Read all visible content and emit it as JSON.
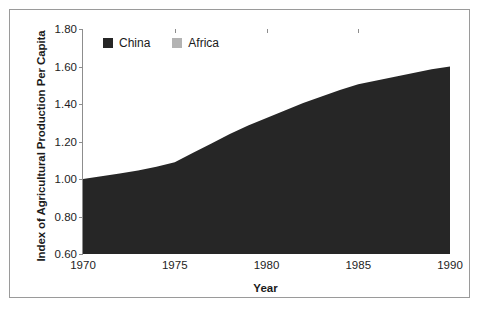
{
  "chart_data": {
    "type": "area",
    "title": "",
    "subtitle": "",
    "xlabel": "Year",
    "ylabel": "Index of Agricultural Production Per Capita",
    "xlim": [
      1970,
      1990
    ],
    "ylim": [
      0.6,
      1.8
    ],
    "ytick_labels": [
      "0.60",
      "0.80",
      "1.00",
      "1.20",
      "1.40",
      "1.60",
      "1.80"
    ],
    "ytick_values": [
      0.6,
      0.8,
      1.0,
      1.2,
      1.4,
      1.6,
      1.8
    ],
    "xtick_labels": [
      "1970",
      "1975",
      "1980",
      "1985",
      "1990"
    ],
    "xtick_values": [
      1970,
      1975,
      1980,
      1985,
      1990
    ],
    "grid": false,
    "legend_position": "top-left",
    "overlap_mode": "overlaid",
    "x": [
      1970,
      1971,
      1972,
      1973,
      1974,
      1975,
      1976,
      1977,
      1978,
      1979,
      1980,
      1981,
      1982,
      1983,
      1984,
      1985,
      1986,
      1987,
      1988,
      1989,
      1990
    ],
    "series": [
      {
        "name": "China",
        "color": "#262626",
        "values": [
          1.0,
          1.015,
          1.03,
          1.045,
          1.065,
          1.09,
          1.14,
          1.19,
          1.24,
          1.285,
          1.325,
          1.365,
          1.405,
          1.44,
          1.475,
          1.505,
          1.525,
          1.545,
          1.565,
          1.585,
          1.6
        ]
      },
      {
        "name": "Africa",
        "color": "#b3b3b3",
        "values": [
          1.0,
          0.99,
          0.98,
          0.972,
          0.964,
          0.957,
          0.95,
          0.944,
          0.938,
          0.932,
          0.927,
          0.922,
          0.918,
          0.915,
          0.912,
          0.91,
          0.905,
          0.9,
          0.895,
          0.89,
          0.882
        ]
      }
    ]
  },
  "legend": {
    "items": [
      {
        "label": "China",
        "color": "#262626"
      },
      {
        "label": "Africa",
        "color": "#b3b3b3"
      }
    ]
  },
  "colors": {
    "china": "#262626",
    "africa": "#b3b3b3",
    "axis": "#8d8d8d",
    "frame": "#9a9a9a",
    "text": "#1d1d1d",
    "background": "#ffffff"
  }
}
